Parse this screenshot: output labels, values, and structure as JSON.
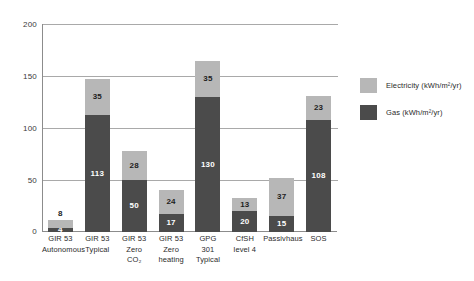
{
  "chart_data": {
    "type": "bar",
    "stacked": true,
    "title": "",
    "subtitle": "",
    "xlabel": "",
    "ylabel": "",
    "ylim": [
      0,
      200
    ],
    "yticks": [
      "0",
      "50",
      "100",
      "150",
      "200"
    ],
    "grid": true,
    "legend_position": "right",
    "categories": [
      "GIR 53 Autonomous",
      "GIR 53 Typical",
      "GIR 53 Zero CO2",
      "GIR 53 Zero heating",
      "GPG 301 Typical",
      "CfSH level 4",
      "Passivhaus",
      "SOS"
    ],
    "category_lines": [
      [
        "GIR 53",
        "Autonomous"
      ],
      [
        "GIR 53",
        "Typical"
      ],
      [
        "GIR 53",
        "Zero",
        "CO₂"
      ],
      [
        "GIR 53",
        "Zero",
        "heating"
      ],
      [
        "GPG",
        "301",
        "Typical"
      ],
      [
        "CfSH",
        "level 4"
      ],
      [
        "Passivhaus"
      ],
      [
        "SOS"
      ]
    ],
    "series": [
      {
        "name": "Gas (kWh/m²/yr)",
        "color": "#4b4b4b",
        "values": [
          4,
          113,
          50,
          17,
          130,
          20,
          15,
          108
        ]
      },
      {
        "name": "Electricity (kWh/m²/yr)",
        "color": "#b7b7b7",
        "values": [
          8,
          35,
          28,
          24,
          35,
          13,
          37,
          23
        ]
      }
    ],
    "totals": [
      12,
      148,
      78,
      41,
      165,
      33,
      52,
      131
    ]
  },
  "legend": {
    "items": [
      {
        "label": "Electricity (kWh/m²/yr)",
        "color": "#b7b7b7"
      },
      {
        "label": "Gas (kWh/m²/yr)",
        "color": "#4b4b4b"
      }
    ]
  },
  "colors": {
    "electricity": "#b7b7b7",
    "gas": "#4b4b4b",
    "axis": "#8c8c8c",
    "grid": "#a9a9a9",
    "background": "#ffffff"
  }
}
